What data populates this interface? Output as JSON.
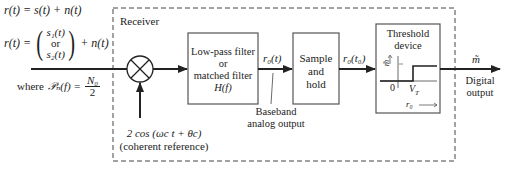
{
  "input_equations": {
    "line1": "r(t) = s(t) + n(t)",
    "line2_prefix": "r(t) =",
    "line2_top": "s₁(t)",
    "line2_mid": "or",
    "line2_bot": "s₂(t)",
    "line2_suffix": "+ n(t)",
    "psd_prefix": "where",
    "psd_lhs": "𝒫ₙ(f) =",
    "psd_num": "N₀",
    "psd_den": "2"
  },
  "receiver": {
    "label": "Receiver"
  },
  "mixer": {
    "symbol": "multiplier",
    "reference_signal": "2 cos (ωc t + θc)",
    "reference_label": "(coherent reference)"
  },
  "lowpass_filter": {
    "line1": "Low-pass filter",
    "line2": "or",
    "line3": "matched filter",
    "line4": "H(f)"
  },
  "filter_output": {
    "signal": "r₀(t)",
    "annotation_line1": "Baseband",
    "annotation_line2": "analog output"
  },
  "sample_hold": {
    "line1": "Sample",
    "line2": "and",
    "line3": "hold"
  },
  "sample_output": {
    "signal": "r₀(t₀)"
  },
  "threshold_device": {
    "line1": "Threshold",
    "line2": "device",
    "y_axis": "m̃",
    "origin": "0",
    "threshold": "V",
    "threshold_sub": "T",
    "x_axis": "r₀"
  },
  "output": {
    "signal": "m̃",
    "label_line1": "Digital",
    "label_line2": "output"
  },
  "colors": {
    "line": "#222222",
    "dashed": "#444444",
    "box_border": "#555555",
    "background": "#ffffff"
  }
}
